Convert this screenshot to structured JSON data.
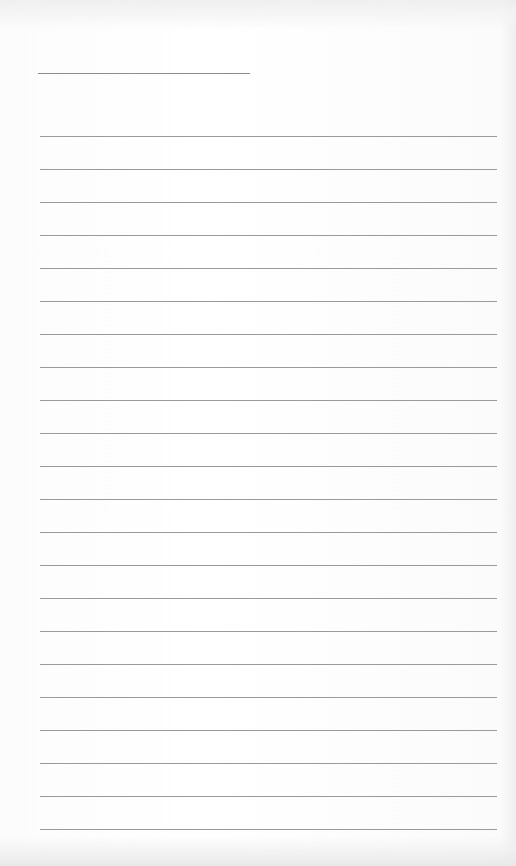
{
  "page": {
    "type": "lined-paper",
    "header_line": {
      "top": 73,
      "left": 38,
      "width": 212
    },
    "rules": {
      "count": 22,
      "first_top": 136,
      "spacing": 33,
      "left": 40,
      "width": 457
    },
    "colors": {
      "paper": "#fdfdfd",
      "rule": "#9a9a9a",
      "header_line": "#8c8c8c"
    }
  }
}
